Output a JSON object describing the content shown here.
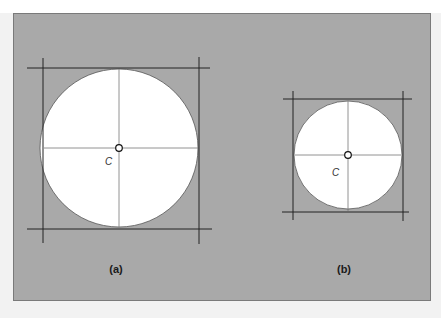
{
  "figure": {
    "background_color": "#a9a9a9",
    "circle_fill": "#ffffff",
    "line_color": "#222222",
    "panels": [
      {
        "id": "a",
        "caption": "(a)",
        "center_label": "C",
        "circle": {
          "cx": 119,
          "cy": 148,
          "r": 79
        },
        "bounding_lines": {
          "left_x": 43,
          "right_x": 199,
          "top_y": 68,
          "bottom_y": 229
        }
      },
      {
        "id": "b",
        "caption": "(b)",
        "center_label": "C",
        "circle": {
          "cx": 348,
          "cy": 155,
          "r": 54
        },
        "bounding_lines": {
          "left_x": 293,
          "right_x": 403,
          "top_y": 99,
          "bottom_y": 212
        }
      }
    ]
  }
}
